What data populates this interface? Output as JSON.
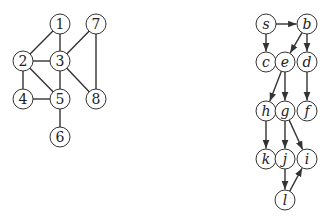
{
  "graphs": [
    {
      "name": "undirected-graph",
      "directed": false,
      "label_style": "numeric",
      "nodes": [
        {
          "id": "1",
          "label": "1",
          "x": 60,
          "y": 24
        },
        {
          "id": "2",
          "label": "2",
          "x": 23,
          "y": 61
        },
        {
          "id": "3",
          "label": "3",
          "x": 60,
          "y": 61
        },
        {
          "id": "4",
          "label": "4",
          "x": 23,
          "y": 99
        },
        {
          "id": "5",
          "label": "5",
          "x": 60,
          "y": 99
        },
        {
          "id": "6",
          "label": "6",
          "x": 60,
          "y": 137
        },
        {
          "id": "7",
          "label": "7",
          "x": 96,
          "y": 24
        },
        {
          "id": "8",
          "label": "8",
          "x": 96,
          "y": 99
        }
      ],
      "edges": [
        [
          "1",
          "2"
        ],
        [
          "1",
          "3"
        ],
        [
          "2",
          "3"
        ],
        [
          "2",
          "4"
        ],
        [
          "2",
          "5"
        ],
        [
          "3",
          "5"
        ],
        [
          "3",
          "7"
        ],
        [
          "3",
          "8"
        ],
        [
          "4",
          "5"
        ],
        [
          "5",
          "6"
        ],
        [
          "7",
          "8"
        ]
      ]
    },
    {
      "name": "directed-graph",
      "directed": true,
      "label_style": "italic",
      "nodes": [
        {
          "id": "s",
          "label": "s",
          "x": 266,
          "y": 24
        },
        {
          "id": "b",
          "label": "b",
          "x": 307,
          "y": 24
        },
        {
          "id": "c",
          "label": "c",
          "x": 266,
          "y": 62
        },
        {
          "id": "e",
          "label": "e",
          "x": 285,
          "y": 62
        },
        {
          "id": "d",
          "label": "d",
          "x": 307,
          "y": 62
        },
        {
          "id": "h",
          "label": "h",
          "x": 266,
          "y": 111
        },
        {
          "id": "g",
          "label": "g",
          "x": 285,
          "y": 111
        },
        {
          "id": "f",
          "label": "f",
          "x": 307,
          "y": 111
        },
        {
          "id": "k",
          "label": "k",
          "x": 266,
          "y": 159
        },
        {
          "id": "j",
          "label": "j",
          "x": 285,
          "y": 159
        },
        {
          "id": "i",
          "label": "i",
          "x": 307,
          "y": 159
        },
        {
          "id": "l",
          "label": "l",
          "x": 285,
          "y": 200
        }
      ],
      "edges": [
        [
          "s",
          "b"
        ],
        [
          "s",
          "c"
        ],
        [
          "b",
          "e"
        ],
        [
          "b",
          "d"
        ],
        [
          "e",
          "h"
        ],
        [
          "e",
          "g"
        ],
        [
          "d",
          "f"
        ],
        [
          "h",
          "k"
        ],
        [
          "g",
          "j"
        ],
        [
          "g",
          "i"
        ],
        [
          "j",
          "l"
        ],
        [
          "l",
          "i"
        ]
      ]
    }
  ],
  "style": {
    "node_radius": 10,
    "stroke": "#333333",
    "background": "#ffffff"
  }
}
